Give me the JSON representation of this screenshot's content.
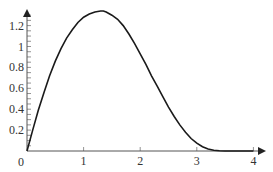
{
  "chart_data": {
    "type": "line",
    "title": "",
    "xlabel": "",
    "ylabel": "",
    "xlim": [
      0,
      4
    ],
    "ylim": [
      0,
      1.3
    ],
    "x_ticks": [
      0,
      1,
      2,
      3,
      4
    ],
    "x_tick_labels": [
      "0",
      "1",
      "2",
      "3",
      "4"
    ],
    "y_ticks": [
      0.2,
      0.4,
      0.6,
      0.8,
      1,
      1.2
    ],
    "y_tick_labels": [
      "0.2",
      "0.4",
      "0.6",
      "0.8",
      "1",
      "1.2"
    ],
    "y_minor_tick_step": 0.05,
    "grid": false,
    "legend": null,
    "series": [
      {
        "name": "f(x)",
        "color": "#1a1a1a",
        "x": [
          0,
          0.1,
          0.2,
          0.3,
          0.4,
          0.5,
          0.6,
          0.7,
          0.8,
          0.9,
          1.0,
          1.1,
          1.2,
          1.3,
          1.35,
          1.4,
          1.5,
          1.6,
          1.7,
          1.8,
          1.9,
          2.0,
          2.1,
          2.2,
          2.3,
          2.4,
          2.5,
          2.6,
          2.7,
          2.8,
          2.9,
          3.0,
          3.1,
          3.2,
          3.3,
          3.4,
          3.5,
          3.6,
          3.7,
          3.8,
          3.9,
          4.0
        ],
        "y": [
          0,
          0.2,
          0.39,
          0.56,
          0.72,
          0.86,
          0.98,
          1.08,
          1.16,
          1.23,
          1.28,
          1.31,
          1.33,
          1.34,
          1.34,
          1.33,
          1.3,
          1.26,
          1.2,
          1.12,
          1.03,
          0.93,
          0.83,
          0.72,
          0.62,
          0.52,
          0.42,
          0.33,
          0.25,
          0.18,
          0.12,
          0.075,
          0.04,
          0.018,
          0.007,
          0.002,
          0.0,
          0.0,
          0.0,
          0.0,
          0.0,
          0.0
        ]
      }
    ]
  }
}
